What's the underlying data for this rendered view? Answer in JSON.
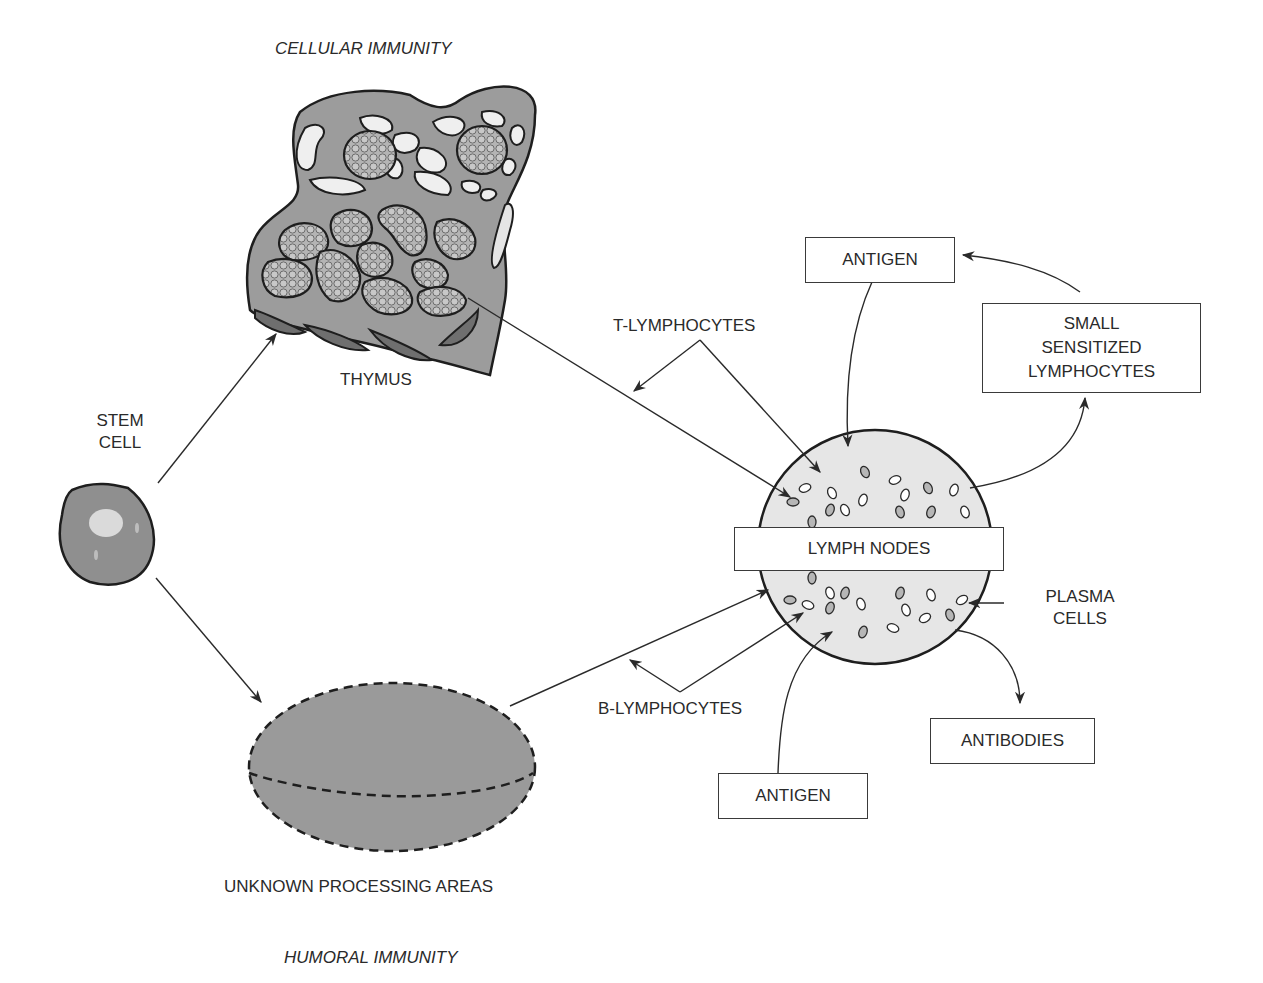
{
  "diagram": {
    "section_titles": {
      "top": "CELLULAR IMMUNITY",
      "bottom": "HUMORAL IMMUNITY"
    },
    "nodes": {
      "stem_cell": "STEM CELL",
      "stem_cell_line1": "STEM",
      "stem_cell_line2": "CELL",
      "thymus": "THYMUS",
      "unknown_areas": "UNKNOWN PROCESSING AREAS",
      "lymph_nodes": "LYMPH NODES"
    },
    "labels": {
      "t_lymphocytes": "T-LYMPHOCYTES",
      "b_lymphocytes": "B-LYMPHOCYTES",
      "plasma_line1": "PLASMA",
      "plasma_line2": "CELLS"
    },
    "boxes": {
      "antigen_top": "ANTIGEN",
      "antigen_bottom": "ANTIGEN",
      "sensitized_line1": "SMALL",
      "sensitized_line2": "SENSITIZED",
      "sensitized_line3": "LYMPHOCYTES",
      "antibodies": "ANTIBODIES"
    },
    "colors": {
      "outline": "#2a2a2a",
      "tissue_fill": "#a8a8a8",
      "lymph_fill": "#e4e4e4",
      "background": "#ffffff"
    }
  }
}
